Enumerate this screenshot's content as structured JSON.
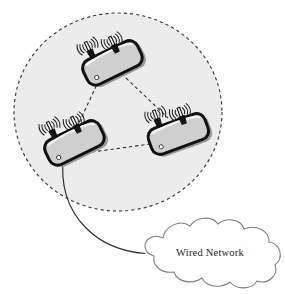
{
  "figure": {
    "type": "network-topology-diagram",
    "title": "",
    "background_color": "#ffffff"
  },
  "coverage_area": {
    "name": "wireless-coverage-ellipse",
    "label": "",
    "style": "dashed",
    "fill_color": "#ececec",
    "stroke_color": "#3a3a3a",
    "center": {
      "x": 118,
      "y": 112
    },
    "radius": {
      "x": 104,
      "y": 99
    }
  },
  "nodes": [
    {
      "id": "ap-top",
      "name": "access-point-top",
      "label": "",
      "x": 112,
      "y": 62,
      "rotation": -26,
      "antennas": 2,
      "body_fill": "#cfcfcf",
      "body_stroke": "#111111"
    },
    {
      "id": "ap-left",
      "name": "access-point-left",
      "label": "",
      "x": 74,
      "y": 142,
      "rotation": -26,
      "antennas": 2,
      "body_fill": "#cfcfcf",
      "body_stroke": "#111111"
    },
    {
      "id": "ap-right",
      "name": "access-point-right",
      "label": "",
      "x": 178,
      "y": 133,
      "rotation": -20,
      "antennas": 2,
      "body_fill": "#cfcfcf",
      "body_stroke": "#111111"
    }
  ],
  "wireless_links": [
    {
      "name": "link-top-left",
      "from": "ap-top",
      "to": "ap-left",
      "style": "dashed"
    },
    {
      "name": "link-top-right",
      "from": "ap-top",
      "to": "ap-right",
      "style": "dashed"
    },
    {
      "name": "link-left-right",
      "from": "ap-left",
      "to": "ap-right",
      "style": "dashed"
    }
  ],
  "wired_link": {
    "name": "wired-cable",
    "from": "ap-left",
    "to": "wired-network-cloud",
    "style": "solid",
    "stroke_color": "#2b2b2b"
  },
  "cloud": {
    "name": "wired-network-cloud",
    "label": "Wired Network",
    "fill_color": "#ffffff",
    "stroke_color": "#7d7d7d",
    "center": {
      "x": 210,
      "y": 253
    }
  }
}
